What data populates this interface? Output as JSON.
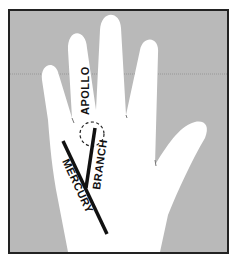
{
  "diagram": {
    "type": "palmistry-hand-diagram",
    "labels": {
      "apollo": "APOLLO",
      "branch": "BRANCH",
      "mercury": "MERCURY"
    },
    "colors": {
      "background": "#b9b9b9",
      "hand": "#ffffff",
      "line": "#111111",
      "frame": "#222222"
    }
  }
}
